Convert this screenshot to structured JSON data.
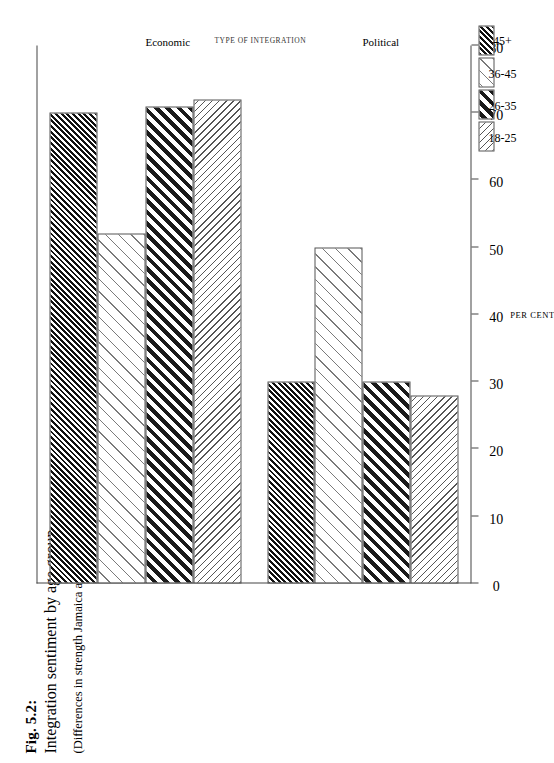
{
  "caption": {
    "figure_number": "Fig. 5.2:",
    "title": "Integration sentiment by age group.",
    "subtitle": "(Differences in strength Jamaica and Saint Lucia)"
  },
  "axes": {
    "value_axis_label": "PER CENT",
    "category_axis_label": "TYPE OF INTEGRATION",
    "ticks": [
      "0",
      "10",
      "20",
      "30",
      "40",
      "50",
      "60",
      "70",
      "80"
    ]
  },
  "legend": {
    "items": [
      {
        "label": "18-25",
        "pattern": "light-thin-forward-hatch"
      },
      {
        "label": "26-35",
        "pattern": "heavy-thick-backward-hatch"
      },
      {
        "label": "36-45",
        "pattern": "very-light-wide-backward-hatch"
      },
      {
        "label": "45+",
        "pattern": "dense-dark-backward-hatch"
      }
    ]
  },
  "chart_data": {
    "type": "bar",
    "orientation": "horizontal",
    "title": "Integration sentiment by age group.",
    "subtitle": "(Differences in strength Jamaica and Saint Lucia)",
    "xlabel": "TYPE OF INTEGRATION",
    "ylabel": "PER CENT",
    "ylim": [
      0,
      80
    ],
    "ytick_step": 10,
    "grid": false,
    "legend_position": "bottom-right",
    "categories": [
      "Economic",
      "Political"
    ],
    "series": [
      {
        "name": "18-25",
        "values": [
          72,
          28
        ]
      },
      {
        "name": "26-35",
        "values": [
          71,
          30
        ]
      },
      {
        "name": "36-45",
        "values": [
          52,
          50
        ]
      },
      {
        "name": "45+",
        "values": [
          70,
          30
        ]
      }
    ]
  }
}
